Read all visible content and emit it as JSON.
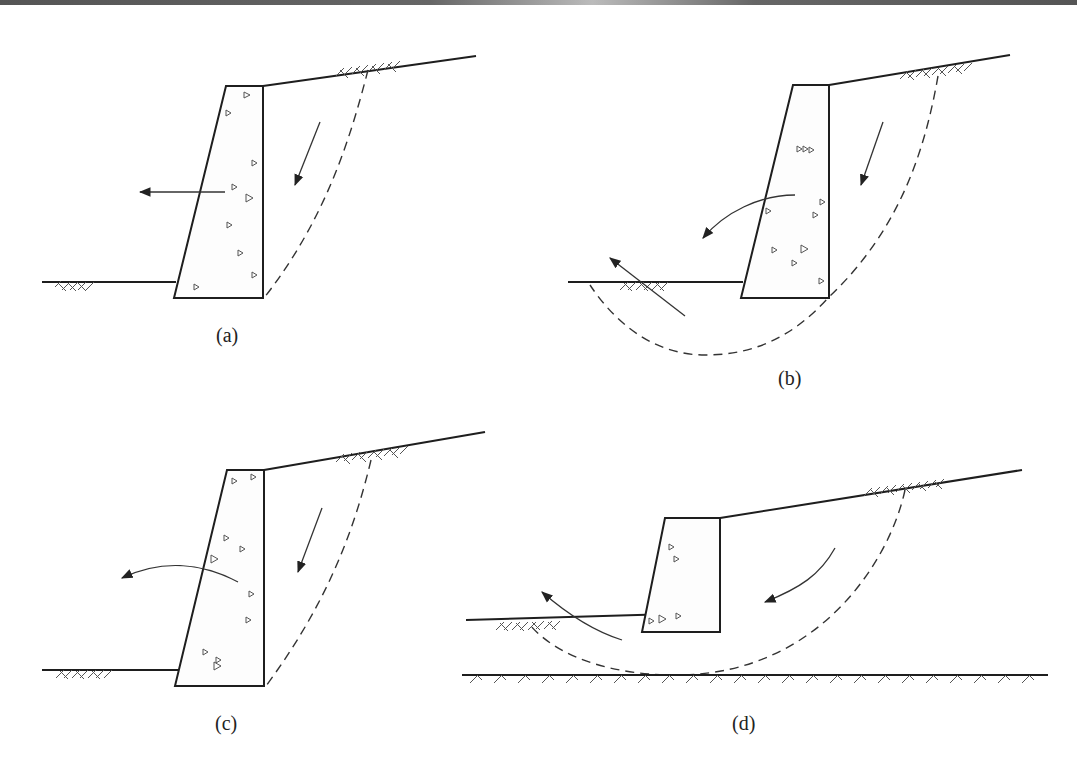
{
  "figure": {
    "panels": [
      {
        "id": "a",
        "label": "(a)",
        "mode": "sliding"
      },
      {
        "id": "b",
        "label": "(b)",
        "mode": "deep-seated rotational slip through foundation"
      },
      {
        "id": "c",
        "label": "(c)",
        "mode": "overturning"
      },
      {
        "id": "d",
        "label": "(d)",
        "mode": "overall slope failure"
      }
    ]
  },
  "colors": {
    "line": "#1e1e1e",
    "hatch": "#555555",
    "background": "#ffffff"
  }
}
